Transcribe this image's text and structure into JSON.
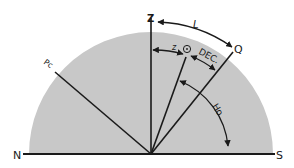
{
  "diagram": {
    "colors": {
      "sky": "#c8c8c8",
      "line": "#1a1a1a",
      "background": "#ffffff"
    },
    "labels": {
      "north": "N",
      "south": "S",
      "zenith": "Z",
      "equator": "Q",
      "pole": "Pc",
      "latitude": "L",
      "zenith_distance": "z",
      "sun": "⊙",
      "declination": "DEC.",
      "altitude": "Ho"
    }
  }
}
